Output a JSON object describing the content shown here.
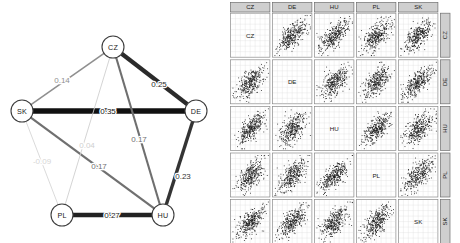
{
  "figure": {
    "title": "",
    "panels": [
      "network-graph",
      "scatterplot-matrix"
    ]
  },
  "network": {
    "name": "partial-correlation-network",
    "nodes": [
      {
        "id": "CZ",
        "label": "CZ",
        "x": 113,
        "y": 47
      },
      {
        "id": "SK",
        "label": "SK",
        "x": 22,
        "y": 111
      },
      {
        "id": "DE",
        "label": "DE",
        "x": 196,
        "y": 111
      },
      {
        "id": "PL",
        "label": "PL",
        "x": 62,
        "y": 215
      },
      {
        "id": "HU",
        "label": "HU",
        "x": 163,
        "y": 215
      }
    ],
    "node_radius": 11,
    "edges": [
      {
        "from": "SK",
        "to": "CZ",
        "label": "0.14",
        "value": 0.14,
        "width": 1.6,
        "color": "#8f8f8f",
        "lx": 62,
        "ly": 80
      },
      {
        "from": "CZ",
        "to": "DE",
        "label": "0.25",
        "value": 0.25,
        "width": 4.2,
        "color": "#2b2b2b",
        "lx": 159,
        "ly": 84
      },
      {
        "from": "SK",
        "to": "DE",
        "label": "0.35",
        "value": 0.35,
        "width": 5.6,
        "color": "#111111",
        "lx": 108,
        "ly": 111
      },
      {
        "from": "CZ",
        "to": "HU",
        "label": "0.17",
        "value": 0.17,
        "width": 2.1,
        "color": "#6f6f6f",
        "lx": 139,
        "ly": 139
      },
      {
        "from": "DE",
        "to": "HU",
        "label": "0.23",
        "value": 0.23,
        "width": 3.4,
        "color": "#343434",
        "lx": 183,
        "ly": 176
      },
      {
        "from": "PL",
        "to": "HU",
        "label": "0.27",
        "value": 0.27,
        "width": 4.4,
        "color": "#222222",
        "lx": 112,
        "ly": 215
      },
      {
        "from": "SK",
        "to": "HU",
        "label": "0.17",
        "value": 0.17,
        "width": 2.2,
        "color": "#707070",
        "lx": 99,
        "ly": 166
      },
      {
        "from": "CZ",
        "to": "PL",
        "label": "0.04",
        "value": 0.04,
        "width": 0.9,
        "color": "#cfcfcf",
        "lx": 87,
        "ly": 145
      },
      {
        "from": "SK",
        "to": "PL",
        "label": "-0.09",
        "value": -0.09,
        "width": 0.9,
        "color": "#d6d6d6",
        "lx": 42,
        "ly": 161
      }
    ]
  },
  "matrix": {
    "name": "scatterplot-matrix",
    "variables": [
      "CZ",
      "DE",
      "HU",
      "PL",
      "SK"
    ],
    "column_headers": [
      "CZ",
      "DE",
      "HU",
      "PL",
      "SK"
    ],
    "row_headers": [
      "CZ",
      "DE",
      "HU",
      "PL",
      "SK"
    ],
    "diagonal_labels": [
      "CZ",
      "DE",
      "HU",
      "PL",
      "SK"
    ],
    "points_per_cell": 330,
    "grid_lines": 8
  },
  "chart_data": {
    "type": "scatter",
    "title": "",
    "xlabel": "",
    "ylabel": "",
    "panels": [
      {
        "type": "network",
        "name": "Partial correlation network of country indices",
        "nodes": [
          "CZ",
          "SK",
          "DE",
          "PL",
          "HU"
        ],
        "edges": [
          {
            "pair": [
              "SK",
              "CZ"
            ],
            "weight": 0.14
          },
          {
            "pair": [
              "CZ",
              "DE"
            ],
            "weight": 0.25
          },
          {
            "pair": [
              "SK",
              "DE"
            ],
            "weight": 0.35
          },
          {
            "pair": [
              "CZ",
              "HU"
            ],
            "weight": 0.17
          },
          {
            "pair": [
              "DE",
              "HU"
            ],
            "weight": 0.23
          },
          {
            "pair": [
              "PL",
              "HU"
            ],
            "weight": 0.27
          },
          {
            "pair": [
              "SK",
              "HU"
            ],
            "weight": 0.17
          },
          {
            "pair": [
              "CZ",
              "PL"
            ],
            "weight": 0.04
          },
          {
            "pair": [
              "SK",
              "PL"
            ],
            "weight": -0.09
          }
        ],
        "edge_weight_range": [
          -0.09,
          0.35
        ]
      },
      {
        "type": "scatter",
        "name": "Pairwise scatterplot matrix",
        "variables": [
          "CZ",
          "DE",
          "HU",
          "PL",
          "SK"
        ],
        "grid": "5x5",
        "diagonal": "variable-name-panels",
        "off_diagonal": "bivariate scatter clouds with positive diagonal trend"
      }
    ]
  }
}
